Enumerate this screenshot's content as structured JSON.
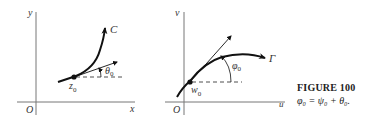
{
  "figure": {
    "title": "FIGURE 100",
    "equation": "φ₀ = ψ₀ + θ₀."
  },
  "left_panel": {
    "x_axis_label": "x",
    "y_axis_label": "y",
    "origin_label": "O",
    "curve_label": "C",
    "point_label": "z",
    "point_sub": "0",
    "angle_label": "θ",
    "angle_sub": "0"
  },
  "right_panel": {
    "x_axis_label": "u",
    "y_axis_label": "v",
    "origin_label": "O",
    "curve_label": "Γ",
    "point_label": "w",
    "point_sub": "0",
    "angle_label": "φ",
    "angle_sub": "0"
  },
  "colors": {
    "axis": "#777777",
    "curve": "#111111",
    "text": "#333333"
  }
}
